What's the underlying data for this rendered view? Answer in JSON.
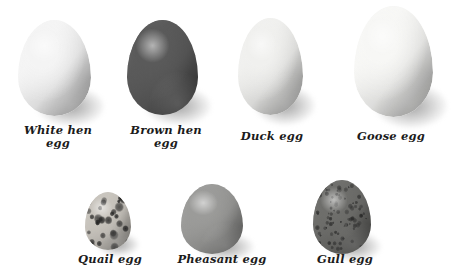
{
  "figure": {
    "background_color": "#ffffff",
    "style": "grayscale photographic illustration",
    "rows": 2,
    "total_eggs": 7
  },
  "eggs": [
    {
      "id": "white-hen",
      "label": "White hen\negg",
      "name": "White hen egg",
      "row": 1,
      "shell_color": "#f4f4f4",
      "shade_color": "#b9b9b9",
      "pattern": "plain",
      "relative_size": "large",
      "x": 18,
      "y": 20,
      "w": 73,
      "h": 96,
      "label_x": 8,
      "label_y": 124,
      "label_w": 100
    },
    {
      "id": "brown-hen",
      "label": "Brown hen\negg",
      "name": "Brown hen egg",
      "row": 1,
      "shell_color": "#5a5a5a",
      "shade_color": "#2e2e2e",
      "pattern": "plain",
      "relative_size": "large",
      "x": 127,
      "y": 20,
      "w": 71,
      "h": 95,
      "label_x": 116,
      "label_y": 124,
      "label_w": 100
    },
    {
      "id": "duck",
      "label": "Duck egg",
      "name": "Duck egg",
      "row": 1,
      "shell_color": "#f0f0ee",
      "shade_color": "#bdbdbd",
      "pattern": "plain",
      "relative_size": "large",
      "x": 238,
      "y": 18,
      "w": 65,
      "h": 97,
      "label_x": 222,
      "label_y": 130,
      "label_w": 100
    },
    {
      "id": "goose",
      "label": "Goose egg",
      "name": "Goose egg",
      "row": 1,
      "shell_color": "#f7f7f5",
      "shade_color": "#b5b5b5",
      "pattern": "plain",
      "relative_size": "largest",
      "x": 354,
      "y": 6,
      "w": 79,
      "h": 111,
      "label_x": 338,
      "label_y": 130,
      "label_w": 106
    },
    {
      "id": "quail",
      "label": "Quail egg",
      "name": "Quail egg",
      "row": 2,
      "shell_color": "#c8c4bd",
      "shade_color": "#6f6c66",
      "pattern": "bold-blotches",
      "relative_size": "smallest",
      "x": 85,
      "y": 192,
      "w": 46,
      "h": 58,
      "label_x": 60,
      "label_y": 253,
      "label_w": 100
    },
    {
      "id": "pheasant",
      "label": "Pheasant egg",
      "name": "Pheasant egg",
      "row": 2,
      "shell_color": "#9b9b99",
      "shade_color": "#6a6a68",
      "pattern": "plain",
      "relative_size": "medium",
      "x": 181,
      "y": 184,
      "w": 62,
      "h": 70,
      "label_x": 162,
      "label_y": 253,
      "label_w": 120
    },
    {
      "id": "gull",
      "label": "Gull egg",
      "name": "Gull egg",
      "row": 2,
      "shell_color": "#6e6e6b",
      "shade_color": "#3c3c3a",
      "pattern": "fine-speckles",
      "relative_size": "medium-large",
      "x": 313,
      "y": 180,
      "w": 58,
      "h": 74,
      "label_x": 295,
      "label_y": 253,
      "label_w": 100
    }
  ]
}
